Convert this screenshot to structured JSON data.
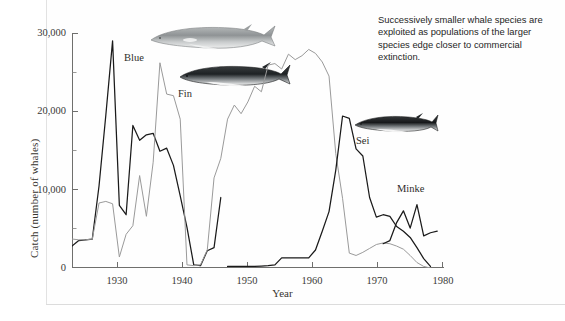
{
  "caption": {
    "text": "Successively smaller whale species are exploited as populations of the larger species edge closer to commercial extinction."
  },
  "axes": {
    "xlabel": "Year",
    "ylabel": "Catch (number of whales)",
    "yticks": [
      "0",
      "10,000",
      "20,000",
      "30,000"
    ],
    "xticks": [
      "1930",
      "1940",
      "1950",
      "1960",
      "1970",
      "1980"
    ]
  },
  "series_labels": {
    "blue": "Blue",
    "fin": "Fin",
    "sei": "Sei",
    "minke": "Minke"
  },
  "illustrations": {
    "blue_whale": "blue-whale-illustration",
    "fin_whale": "fin-whale-illustration",
    "sei_whale": "sei-whale-illustration"
  },
  "chart_data": {
    "type": "line",
    "title": "",
    "xlabel": "Year",
    "ylabel": "Catch (number of whales)",
    "xlim": [
      1925,
      1980
    ],
    "ylim": [
      0,
      30000
    ],
    "yticks": [
      0,
      10000,
      20000,
      30000
    ],
    "yminorticks": [
      5000,
      15000,
      25000
    ],
    "xticks": [
      1930,
      1940,
      1950,
      1960,
      1970,
      1980
    ],
    "grid": false,
    "legend": "inline-annotations",
    "colors": {
      "blue": "#1a1a1a",
      "fin": "#9a9a9a",
      "sei": "#1a1a1a",
      "minke": "#1a1a1a"
    },
    "series": [
      {
        "name": "Blue",
        "color": "#1a1a1a",
        "x": [
          1925,
          1926,
          1927,
          1928,
          1929,
          1930,
          1931,
          1932,
          1933,
          1934,
          1935,
          1936,
          1937,
          1938,
          1939,
          1940,
          1941,
          1942,
          1943,
          1944,
          1945,
          1946,
          1947
        ],
        "values": [
          2800,
          3500,
          3600,
          3700,
          10500,
          19500,
          29000,
          8000,
          6800,
          18200,
          16300,
          17000,
          17200,
          14900,
          15300,
          13100,
          9200,
          5200,
          400,
          300,
          2200,
          2600,
          9000
        ]
      },
      {
        "name": "Fin",
        "color": "#9a9a9a",
        "x": [
          1925,
          1926,
          1927,
          1928,
          1929,
          1930,
          1931,
          1932,
          1933,
          1934,
          1935,
          1936,
          1937,
          1938,
          1939,
          1940,
          1941,
          1942,
          1943,
          1944,
          1945,
          1946,
          1947,
          1948,
          1949,
          1950,
          1951,
          1952,
          1953,
          1954,
          1955,
          1956,
          1957,
          1958,
          1959,
          1960,
          1961,
          1962,
          1963,
          1964,
          1965,
          1966,
          1967,
          1968,
          1969,
          1970,
          1971,
          1972,
          1973,
          1974,
          1975,
          1976,
          1977,
          1978
        ],
        "values": [
          3700,
          3600,
          3600,
          3700,
          8300,
          8500,
          8200,
          1400,
          4300,
          5400,
          11800,
          6600,
          13500,
          26200,
          22200,
          22000,
          19000,
          400,
          300,
          400,
          2300,
          11500,
          14000,
          19000,
          20800,
          19700,
          21200,
          23200,
          22500,
          25900,
          26100,
          25400,
          27300,
          26600,
          27100,
          27900,
          27400,
          26300,
          24500,
          14600,
          8900,
          1900,
          1600,
          2000,
          2500,
          3000,
          3200,
          3100,
          2800,
          2400,
          1600,
          700,
          200,
          0
        ]
      },
      {
        "name": "Sei",
        "color": "#1a1a1a",
        "x": [
          1948,
          1949,
          1950,
          1951,
          1952,
          1953,
          1954,
          1955,
          1956,
          1957,
          1958,
          1959,
          1960,
          1961,
          1962,
          1963,
          1964,
          1965,
          1966,
          1967,
          1968,
          1969,
          1970,
          1971,
          1972,
          1973,
          1974,
          1975,
          1976,
          1977,
          1978
        ],
        "values": [
          200,
          200,
          200,
          200,
          200,
          250,
          300,
          400,
          1300,
          1300,
          1300,
          1300,
          1300,
          2300,
          4700,
          7200,
          12500,
          19400,
          19100,
          15200,
          14300,
          9000,
          6500,
          6800,
          6600,
          5300,
          4700,
          3900,
          2600,
          1200,
          200
        ]
      },
      {
        "name": "Minke",
        "color": "#1a1a1a",
        "x": [
          1971,
          1972,
          1973,
          1974,
          1975,
          1976,
          1977,
          1978,
          1979
        ],
        "values": [
          3100,
          3500,
          5800,
          7300,
          5100,
          8100,
          4100,
          4500,
          4700
        ]
      }
    ]
  }
}
